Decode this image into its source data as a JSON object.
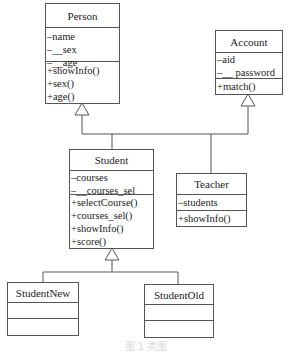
{
  "diagram": {
    "type": "uml-class-diagram",
    "line_color": "#555555",
    "classes": {
      "person": {
        "name": "Person",
        "attributes": [
          "–name",
          "–__sex",
          "–__age"
        ],
        "methods": [
          "+showInfo()",
          "+sex()",
          "+age()"
        ]
      },
      "account": {
        "name": "Account",
        "attributes": [
          "–aid",
          "–__ password"
        ],
        "methods": [
          "+match()"
        ]
      },
      "student": {
        "name": "Student",
        "attributes": [
          "–courses",
          "–__courses_sel"
        ],
        "methods": [
          "+selectCourse()",
          "+courses_sel()",
          "+showInfo()",
          "+score()"
        ]
      },
      "teacher": {
        "name": "Teacher",
        "attributes": [
          "–students"
        ],
        "methods": [
          "+showInfo()"
        ]
      },
      "student_new": {
        "name": "StudentNew",
        "attributes": [],
        "methods": []
      },
      "student_old": {
        "name": "StudentOld",
        "attributes": [],
        "methods": []
      }
    },
    "relations": [
      {
        "type": "generalization",
        "from": "Student",
        "to": "Person"
      },
      {
        "type": "generalization",
        "from": "Teacher",
        "to": "Person"
      },
      {
        "type": "generalization",
        "from": "Teacher",
        "to": "Account"
      },
      {
        "type": "generalization",
        "from": "StudentNew",
        "to": "Student"
      },
      {
        "type": "generalization",
        "from": "StudentOld",
        "to": "Student"
      }
    ],
    "caption": "图 1  类图"
  }
}
